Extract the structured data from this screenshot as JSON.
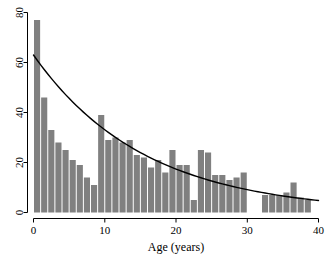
{
  "chart_data": {
    "type": "bar",
    "title": "",
    "subtitle": "",
    "xlabel": "Age (years)",
    "ylabel": "",
    "xlim": [
      0,
      40
    ],
    "ylim": [
      0,
      80
    ],
    "xticks": [
      0,
      10,
      20,
      30,
      40
    ],
    "xtick_labels": [
      "0",
      "10",
      "20",
      "30",
      "40"
    ],
    "yticks": [
      0,
      20,
      40,
      60,
      80
    ],
    "ytick_labels": [
      "0",
      "20",
      "40",
      "60",
      "80"
    ],
    "grid": false,
    "legend": null,
    "bar_color": "#808080",
    "line_color": "#000000",
    "axis_color": "#000000",
    "bin_width": 1,
    "categories": [
      0,
      1,
      2,
      3,
      4,
      5,
      6,
      7,
      8,
      9,
      10,
      11,
      12,
      13,
      14,
      15,
      16,
      17,
      18,
      19,
      20,
      21,
      22,
      23,
      24,
      25,
      26,
      27,
      28,
      29,
      30,
      31,
      32,
      33,
      34,
      35,
      36,
      37,
      38,
      39
    ],
    "values": [
      77,
      46,
      33,
      28,
      25,
      21,
      19,
      14,
      11,
      39,
      29,
      30,
      28,
      29,
      23,
      22,
      18,
      21,
      16,
      25,
      19,
      19,
      5,
      25,
      24,
      15,
      15,
      13,
      14,
      16,
      0,
      0,
      7,
      7,
      7,
      8,
      12,
      6,
      5,
      0
    ],
    "series": [
      {
        "name": "fitted exponential",
        "type": "line",
        "x": [
          0,
          2,
          4,
          6,
          8,
          10,
          12,
          14,
          16,
          18,
          20,
          22,
          24,
          26,
          28,
          30,
          32,
          34,
          36,
          38,
          40
        ],
        "y": [
          63.0,
          55.4,
          48.7,
          42.8,
          37.6,
          33.1,
          29.1,
          25.6,
          22.5,
          19.8,
          17.4,
          15.3,
          13.4,
          11.8,
          10.4,
          9.1,
          8.0,
          7.1,
          6.2,
          5.5,
          4.8
        ]
      }
    ],
    "annotations": []
  }
}
